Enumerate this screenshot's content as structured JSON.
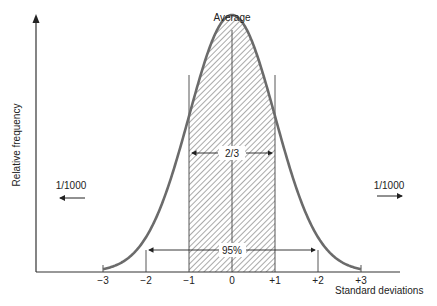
{
  "diagram": {
    "title": "Average",
    "y_axis_label": "Relative frequency",
    "x_axis_label": "Standard deviations",
    "x_ticks": [
      "−3",
      "−2",
      "−1",
      "0",
      "+1",
      "+2",
      "+3"
    ],
    "annotations": {
      "one_sigma": "2/3",
      "two_sigma": "95%",
      "left_tail": "1/1000",
      "right_tail": "1/1000"
    },
    "colors": {
      "curve": "#6b6b6b",
      "axis": "#333333",
      "hatch": "#555555"
    }
  },
  "chart_data": {
    "type": "line",
    "title": "Average",
    "xlabel": "Standard deviations",
    "ylabel": "Relative frequency",
    "x": [
      -3,
      -2,
      -1,
      0,
      1,
      2,
      3
    ],
    "xlim": [
      -3,
      3
    ],
    "series": [
      {
        "name": "Normal distribution",
        "values": [
          0.004,
          0.054,
          0.242,
          0.399,
          0.242,
          0.054,
          0.004
        ]
      }
    ],
    "shaded_region": [
      -1,
      1
    ],
    "annotations": [
      {
        "text": "2/3",
        "range": [
          -1,
          1
        ]
      },
      {
        "text": "95%",
        "range": [
          -2,
          2
        ]
      },
      {
        "text": "1/1000",
        "position": "left tail beyond -3"
      },
      {
        "text": "1/1000",
        "position": "right tail beyond +3"
      }
    ],
    "grid": false
  }
}
